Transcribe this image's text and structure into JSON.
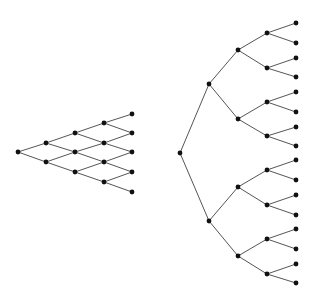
{
  "colors": {
    "edge": "#555555",
    "node": "#111111",
    "background": "#ffffff"
  },
  "node_radius": 2.4,
  "diagrams": [
    {
      "name": "recombining-lattice",
      "nodes": [
        [
          18,
          152
        ],
        [
          46,
          143
        ],
        [
          46,
          162
        ],
        [
          75,
          133
        ],
        [
          75,
          152
        ],
        [
          75,
          172
        ],
        [
          104,
          123
        ],
        [
          104,
          143
        ],
        [
          104,
          162
        ],
        [
          104,
          182
        ],
        [
          132,
          114
        ],
        [
          132,
          133
        ],
        [
          132,
          152
        ],
        [
          132,
          172
        ],
        [
          132,
          192
        ]
      ],
      "edges": [
        [
          0,
          1
        ],
        [
          0,
          2
        ],
        [
          1,
          3
        ],
        [
          1,
          4
        ],
        [
          2,
          4
        ],
        [
          2,
          5
        ],
        [
          3,
          6
        ],
        [
          3,
          7
        ],
        [
          4,
          7
        ],
        [
          4,
          8
        ],
        [
          5,
          8
        ],
        [
          5,
          9
        ],
        [
          6,
          10
        ],
        [
          6,
          11
        ],
        [
          7,
          11
        ],
        [
          7,
          12
        ],
        [
          8,
          12
        ],
        [
          8,
          13
        ],
        [
          9,
          13
        ],
        [
          9,
          14
        ]
      ]
    },
    {
      "name": "binary-tree",
      "nodes": [
        [
          180,
          153
        ],
        [
          209,
          84
        ],
        [
          209,
          221
        ],
        [
          238,
          50
        ],
        [
          238,
          119
        ],
        [
          238,
          187
        ],
        [
          238,
          256
        ],
        [
          267,
          33
        ],
        [
          267,
          68
        ],
        [
          267,
          102
        ],
        [
          267,
          136
        ],
        [
          267,
          170
        ],
        [
          267,
          205
        ],
        [
          267,
          239
        ],
        [
          267,
          274
        ],
        [
          296,
          23
        ],
        [
          296,
          43
        ],
        [
          296,
          58
        ],
        [
          296,
          77
        ],
        [
          296,
          92
        ],
        [
          296,
          112
        ],
        [
          296,
          127
        ],
        [
          296,
          146
        ],
        [
          296,
          160
        ],
        [
          296,
          180
        ],
        [
          296,
          195
        ],
        [
          296,
          215
        ],
        [
          296,
          229
        ],
        [
          296,
          249
        ],
        [
          296,
          264
        ],
        [
          296,
          283
        ]
      ],
      "edges": [
        [
          0,
          1
        ],
        [
          0,
          2
        ],
        [
          1,
          3
        ],
        [
          1,
          4
        ],
        [
          2,
          5
        ],
        [
          2,
          6
        ],
        [
          3,
          7
        ],
        [
          3,
          8
        ],
        [
          4,
          9
        ],
        [
          4,
          10
        ],
        [
          5,
          11
        ],
        [
          5,
          12
        ],
        [
          6,
          13
        ],
        [
          6,
          14
        ],
        [
          7,
          15
        ],
        [
          7,
          16
        ],
        [
          8,
          17
        ],
        [
          8,
          18
        ],
        [
          9,
          19
        ],
        [
          9,
          20
        ],
        [
          10,
          21
        ],
        [
          10,
          22
        ],
        [
          11,
          23
        ],
        [
          11,
          24
        ],
        [
          12,
          25
        ],
        [
          12,
          26
        ],
        [
          13,
          27
        ],
        [
          13,
          28
        ],
        [
          14,
          29
        ],
        [
          14,
          30
        ]
      ]
    }
  ]
}
